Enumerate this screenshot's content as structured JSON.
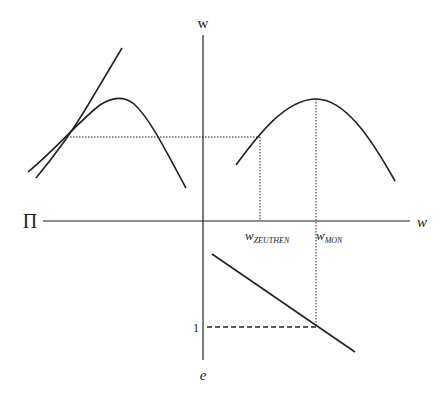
{
  "diagram": {
    "type": "economics-four-quadrant-diagram",
    "colors": {
      "line": "#222222",
      "background": "#ffffff"
    },
    "axes": {
      "vertical_top_label": "w",
      "vertical_bottom_label": "e",
      "horizontal_left_label": "Π",
      "horizontal_right_label": "w"
    },
    "labels": {
      "w_zeuthen_base": "w",
      "w_zeuthen_sub": "ZEUTHEN",
      "w_mon_base": "w",
      "w_mon_sub": "MON",
      "one_tick": "1"
    },
    "elements": [
      {
        "name": "left-profit-hump-curve",
        "style": "solid"
      },
      {
        "name": "left-tangent-curve",
        "style": "solid"
      },
      {
        "name": "right-profit-hump-curve",
        "style": "solid"
      },
      {
        "name": "effort-wage-line",
        "style": "solid"
      },
      {
        "name": "zeuthen-horizontal-guide",
        "style": "dotted"
      },
      {
        "name": "zeuthen-vertical-guide",
        "style": "dotted"
      },
      {
        "name": "mon-vertical-guide",
        "style": "dotted"
      },
      {
        "name": "effort-one-guide",
        "style": "dashed"
      }
    ]
  }
}
